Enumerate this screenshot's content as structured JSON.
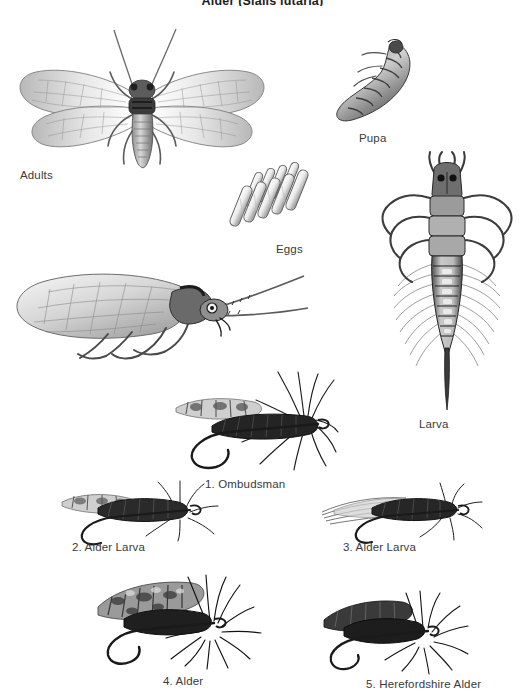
{
  "plate": {
    "title": "Alder (Sialis lutaria)",
    "background_color": "#ffffff",
    "ink_color": "#2b2b2b",
    "caption_color": "#3a3a3a"
  },
  "life_stages": [
    {
      "id": "adults",
      "label": "Adults",
      "icon": "alderfly-adult-wings-spread-icon",
      "caption_x": 20,
      "caption_y": 169
    },
    {
      "id": "pupa",
      "label": "Pupa",
      "icon": "alderfly-pupa-icon",
      "caption_x": 359,
      "caption_y": 132
    },
    {
      "id": "eggs",
      "label": "Eggs",
      "icon": "alderfly-egg-cluster-icon",
      "caption_x": 276,
      "caption_y": 243
    },
    {
      "id": "larva",
      "label": "Larva",
      "icon": "alderfly-larva-icon",
      "caption_x": 419,
      "caption_y": 418
    },
    {
      "id": "adult-side",
      "label": "",
      "icon": "alderfly-adult-side-view-icon",
      "caption_x": 0,
      "caption_y": 0
    }
  ],
  "fly_patterns": [
    {
      "number": "1.",
      "name": "Ombudsman",
      "label": "1. Ombudsman",
      "caption_x": 205,
      "caption_y": 478
    },
    {
      "number": "2.",
      "name": "Alder Larva",
      "label": "2. Alder Larva",
      "caption_x": 72,
      "caption_y": 541
    },
    {
      "number": "3.",
      "name": "Alder Larva",
      "label": "3. Alder Larva",
      "caption_x": 343,
      "caption_y": 541
    },
    {
      "number": "4.",
      "name": "Alder",
      "label": "4. Alder",
      "caption_x": 163,
      "caption_y": 675
    },
    {
      "number": "5.",
      "name": "Herefordshire Alder",
      "label": "5. Herefordshire Alder",
      "caption_x": 366,
      "caption_y": 678
    }
  ]
}
